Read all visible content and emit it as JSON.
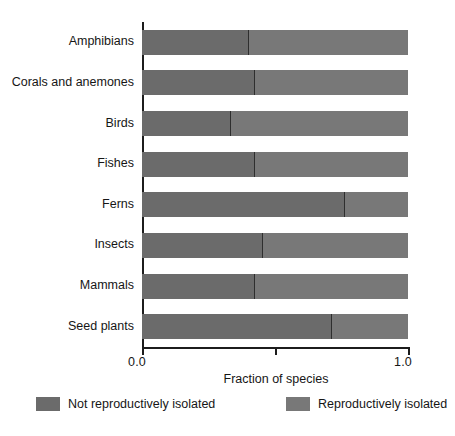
{
  "chart_data": {
    "type": "bar",
    "orientation": "horizontal",
    "stacked": true,
    "normalized": true,
    "title": "",
    "xlabel": "Fraction of species",
    "ylabel": "",
    "xlim": [
      0.0,
      1.0
    ],
    "xticks": [
      0.0,
      0.5,
      1.0
    ],
    "xtick_labels": [
      "0.0",
      "",
      "1.0"
    ],
    "grid": false,
    "legend_position": "bottom",
    "categories": [
      "Amphibians",
      "Corals and anemones",
      "Birds",
      "Fishes",
      "Ferns",
      "Insects",
      "Mammals",
      "Seed plants"
    ],
    "series": [
      {
        "name": "Not reproductively isolated",
        "color": "#6b6b6b",
        "values": [
          0.4,
          0.42,
          0.33,
          0.42,
          0.76,
          0.45,
          0.42,
          0.71
        ]
      },
      {
        "name": "Reproductively isolated",
        "color": "#787878",
        "values": [
          0.6,
          0.58,
          0.67,
          0.58,
          0.24,
          0.55,
          0.58,
          0.29
        ]
      }
    ]
  },
  "axis": {
    "x_title": "Fraction of species",
    "x_tick_min": "0.0",
    "x_tick_max": "1.0"
  },
  "legend": {
    "items": [
      {
        "label": "Not reproductively isolated",
        "color": "#6b6b6b"
      },
      {
        "label": "Reproductively isolated",
        "color": "#787878"
      }
    ]
  },
  "colors": {
    "axis": "#1c1c1c",
    "text": "#161616",
    "background": "#ffffff",
    "segment_not_isolated": "#6b6b6b",
    "segment_isolated": "#787878",
    "divider": "#2e2e2e"
  }
}
